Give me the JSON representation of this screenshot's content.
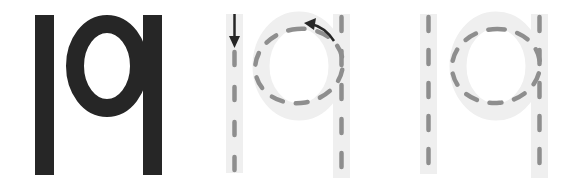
{
  "worksheet": {
    "letters": "lq",
    "panels": [
      {
        "id": "solid",
        "label": "Solid letters lq",
        "style": "solid"
      },
      {
        "id": "guided",
        "label": "Tracing with stroke-direction arrows",
        "style": "dashed-with-arrows"
      },
      {
        "id": "practice",
        "label": "Tracing without arrows",
        "style": "dashed"
      }
    ]
  },
  "colors": {
    "background": "#ffffff",
    "solid_letter": "#262626",
    "trace_band": "#efefef",
    "trace_dash": "#8e8e8e",
    "arrow": "#262626"
  }
}
